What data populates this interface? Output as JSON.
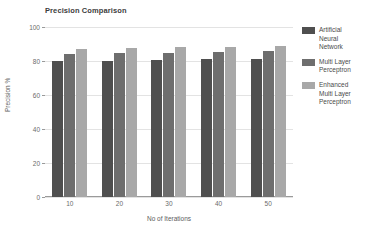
{
  "chart_data": {
    "type": "bar",
    "title": "Precision Comparison",
    "xlabel": "No of Iterations",
    "ylabel": "Precision %",
    "categories": [
      "10",
      "20",
      "30",
      "40",
      "50"
    ],
    "ylim": [
      0,
      100
    ],
    "yticks": [
      "0",
      "20",
      "40",
      "60",
      "80",
      "100"
    ],
    "ytick_values": [
      0,
      20,
      40,
      60,
      80,
      100
    ],
    "grid": true,
    "legend_position": "right",
    "series": [
      {
        "name": "Artificial Neural Network",
        "color": "#4f4f4f",
        "values": [
          80,
          80.3,
          80.6,
          81,
          81.2
        ]
      },
      {
        "name": "Multi Layer Perceptron",
        "color": "#6e6e6e",
        "values": [
          84.3,
          85,
          85,
          85.3,
          85.6
        ]
      },
      {
        "name": "Enhanced Multi Layer Perceptron",
        "color": "#a8a8a8",
        "values": [
          87.3,
          87.8,
          88,
          88.3,
          88.8
        ]
      }
    ]
  },
  "legend": {
    "entries": [
      {
        "label_line1": "Artificial",
        "label_line2": "Neural",
        "label_line3": "Network"
      },
      {
        "label_line1": "Multi Layer",
        "label_line2": "Perceptron",
        "label_line3": ""
      },
      {
        "label_line1": "Enhanced",
        "label_line2": "Multi Layer",
        "label_line3": "Perceptron"
      }
    ]
  },
  "colors": {
    "series_1": "#4f4f4f",
    "series_2": "#6e6e6e",
    "series_3": "#a8a8a8",
    "grid": "#e3e3e3",
    "axis": "#9a9a9a",
    "text": "#5c5c5c",
    "background": "#ffffff"
  }
}
